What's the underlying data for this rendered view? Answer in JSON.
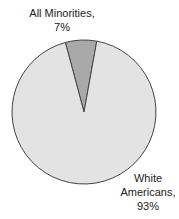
{
  "chart_data": {
    "type": "pie",
    "title": "",
    "slices": [
      {
        "label": "All Minorities",
        "value": 7,
        "display": "7%",
        "color": "#a9a9a9"
      },
      {
        "label": "White Americans",
        "value": 93,
        "display": "93%",
        "color": "#e3e3e3"
      }
    ],
    "labels": {
      "minorities_line1": "All Minorities,",
      "minorities_line2": "7%",
      "white_line1": "White",
      "white_line2": "Americans,",
      "white_line3": "93%"
    },
    "outline_color": "#444444",
    "legend": "none",
    "start_angle_deg": -15
  }
}
